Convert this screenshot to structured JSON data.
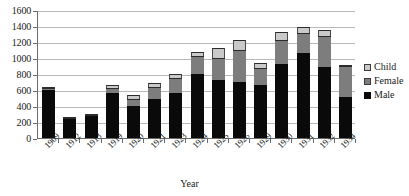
{
  "chart_data": {
    "type": "bar",
    "stacked": true,
    "title": "",
    "xlabel": "Year",
    "ylabel": "",
    "ylim": [
      0,
      1600
    ],
    "ystep": 200,
    "grid": true,
    "legend_position": "right",
    "categories": [
      "1909",
      "1912",
      "1913",
      "1919",
      "1920",
      "1921",
      "1923",
      "1924",
      "1925",
      "1926",
      "1929",
      "1930",
      "1931",
      "1932",
      "1934"
    ],
    "series": [
      {
        "name": "Male",
        "color": "#0a0a0a",
        "values": [
          600,
          235,
          280,
          560,
          400,
          490,
          560,
          800,
          720,
          700,
          660,
          930,
          1060,
          890,
          510
        ]
      },
      {
        "name": "Female",
        "color": "#7d7d7d",
        "values": [
          20,
          5,
          5,
          70,
          90,
          150,
          190,
          220,
          280,
          400,
          220,
          300,
          250,
          380,
          390
        ]
      },
      {
        "name": "Child",
        "color": "#c9c9c9",
        "values": [
          20,
          5,
          5,
          30,
          45,
          50,
          50,
          50,
          120,
          130,
          60,
          90,
          80,
          80,
          10
        ]
      }
    ],
    "totals": [
      640,
      245,
      290,
      660,
      535,
      690,
      800,
      1070,
      1120,
      1230,
      940,
      1320,
      1390,
      1350,
      910
    ],
    "ytick_labels": [
      "0",
      "200",
      "400",
      "600",
      "800",
      "1000",
      "1200",
      "1400",
      "1600"
    ],
    "legend_entries": [
      "Child",
      "Female",
      "Male"
    ]
  }
}
